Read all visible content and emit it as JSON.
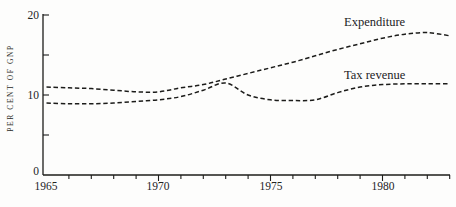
{
  "figure": {
    "background_color": "#fdfdfc",
    "ink_color": "#1c1c1a"
  },
  "chart_data": {
    "type": "line",
    "title": "",
    "xlabel": "",
    "ylabel": "PER CENT OF GNP",
    "x": [
      1965,
      1966,
      1967,
      1968,
      1969,
      1970,
      1971,
      1972,
      1973,
      1974,
      1975,
      1976,
      1977,
      1978,
      1979,
      1980,
      1981,
      1982,
      1983
    ],
    "series": [
      {
        "name": "Expenditure",
        "style": "dashed",
        "values": [
          11.0,
          10.9,
          10.8,
          10.6,
          10.4,
          10.4,
          10.9,
          11.3,
          12.0,
          12.7,
          13.4,
          14.1,
          14.9,
          15.7,
          16.4,
          17.1,
          17.6,
          17.8,
          17.4
        ]
      },
      {
        "name": "Tax revenue",
        "style": "dashed",
        "values": [
          9.0,
          8.9,
          8.9,
          9.0,
          9.2,
          9.4,
          9.8,
          10.6,
          11.5,
          10.0,
          9.4,
          9.3,
          9.4,
          10.3,
          11.0,
          11.3,
          11.4,
          11.4,
          11.4
        ]
      }
    ],
    "xlim": [
      1965,
      1983
    ],
    "ylim": [
      0,
      20
    ],
    "yticks_labeled": [
      0,
      10,
      20
    ],
    "yticks_minor": [
      5,
      15
    ],
    "xticks_labeled": [
      1965,
      1970,
      1975,
      1980
    ],
    "xticks_minor_every_year": true,
    "grid": false,
    "legend_position": "inline-annotations-near-lines"
  }
}
